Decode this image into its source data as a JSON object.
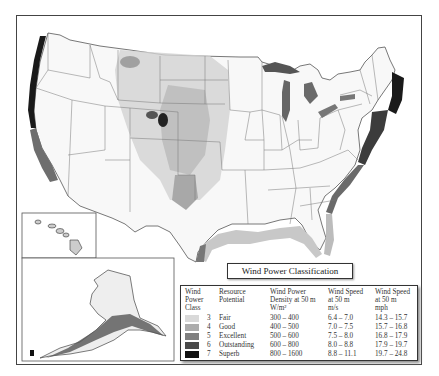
{
  "map": {
    "title": "Wind Power Classification",
    "insets": [
      "Hawaii",
      "Alaska"
    ],
    "colors": {
      "class3": "#d9d9d9",
      "class4": "#acacac",
      "class5": "#7f7f7f",
      "class6": "#4a4a4a",
      "class7": "#111111"
    }
  },
  "legend": {
    "headers": {
      "class": "Wind Power Class",
      "potential": "Resource Potential",
      "density": "Wind Power Density at 50 m W/m²",
      "speed_ms": "Wind Speed at 50 m m/s",
      "speed_mph": "Wind Speed at 50 m mph"
    },
    "header_lines": {
      "class": [
        "Wind",
        "Power",
        "Class"
      ],
      "potential": [
        "Resource",
        "Potential"
      ],
      "density": [
        "Wind Power",
        "Density at 50 m",
        "W/m²"
      ],
      "speed_ms": [
        "Wind Speed",
        "at 50 m",
        "m/s"
      ],
      "speed_mph": [
        "Wind Speed",
        "at 50 m",
        "mph"
      ]
    },
    "rows": [
      {
        "class": "3",
        "potential": "Fair",
        "density": "300 – 400",
        "speed_ms": "6.4 – 7.0",
        "speed_mph": "14.3 – 15.7",
        "color": "#d9d9d9"
      },
      {
        "class": "4",
        "potential": "Good",
        "density": "400 – 500",
        "speed_ms": "7.0 – 7.5",
        "speed_mph": "15.7 – 16.8",
        "color": "#acacac"
      },
      {
        "class": "5",
        "potential": "Excellent",
        "density": "500 – 600",
        "speed_ms": "7.5 – 8.0",
        "speed_mph": "16.8 – 17.9",
        "color": "#7f7f7f"
      },
      {
        "class": "6",
        "potential": "Outstanding",
        "density": "600 – 800",
        "speed_ms": "8.0 – 8.8",
        "speed_mph": "17.9 – 19.7",
        "color": "#4a4a4a"
      },
      {
        "class": "7",
        "potential": "Superb",
        "density": "800 – 1600",
        "speed_ms": "8.8 – 11.1",
        "speed_mph": "19.7 – 24.8",
        "color": "#111111"
      }
    ]
  }
}
